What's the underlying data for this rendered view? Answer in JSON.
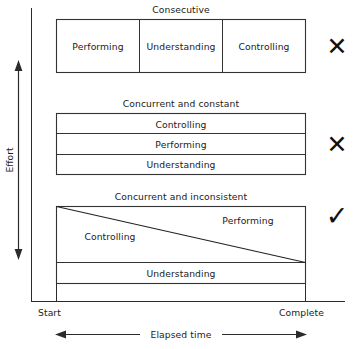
{
  "diagram": {
    "title_hidden": "",
    "axes": {
      "y_label": "Effort",
      "x_label": "Elapsed time",
      "x_start_tick": "Start",
      "x_end_tick": "Complete"
    },
    "groups": [
      {
        "id": "consecutive",
        "title": "Consecutive",
        "layout": "columns",
        "verdict_icon": "cross-icon",
        "verdict_glyph": "✕",
        "cells": [
          {
            "label": "Performing"
          },
          {
            "label": "Understanding"
          },
          {
            "label": "Controlling"
          }
        ]
      },
      {
        "id": "concurrent-and-constant",
        "title": "Concurrent and constant",
        "layout": "rows",
        "verdict_icon": "cross-icon",
        "verdict_glyph": "✕",
        "cells": [
          {
            "label": "Controlling"
          },
          {
            "label": "Performing"
          },
          {
            "label": "Understanding"
          }
        ]
      },
      {
        "id": "concurrent-and-inconsistent",
        "title": "Concurrent and inconsistent",
        "layout": "diagonal-split",
        "verdict_icon": "check-icon",
        "verdict_glyph": "✓",
        "cells": [
          {
            "label": "Controlling"
          },
          {
            "label": "Performing"
          },
          {
            "label": "Understanding"
          }
        ]
      }
    ],
    "colors": {
      "ink": "#1a1a1a",
      "line": "#333333",
      "background": "#ffffff"
    }
  }
}
